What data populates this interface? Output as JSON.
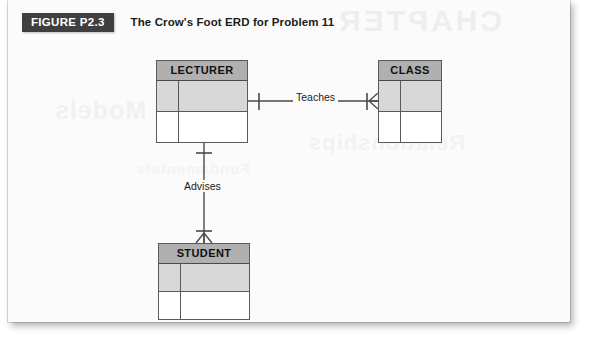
{
  "figure": {
    "tag": "FIGURE P2.3",
    "title": "The Crow's Foot ERD for Problem 11"
  },
  "ghost_text": {
    "chapter": "CHAPTER",
    "line2": "Data Models",
    "line3": "Fundamentals",
    "line4": "Relationships"
  },
  "entities": [
    {
      "id": "lecturer",
      "name": "LECTURER",
      "x": 148,
      "y": 60,
      "width": 92,
      "height": 83,
      "rows": [
        {
          "shaded": true,
          "cells": [
            "",
            ""
          ]
        },
        {
          "shaded": false,
          "cells": [
            "",
            ""
          ]
        }
      ]
    },
    {
      "id": "class",
      "name": "CLASS",
      "x": 370,
      "y": 60,
      "width": 64,
      "height": 83,
      "rows": [
        {
          "shaded": true,
          "cells": [
            "",
            ""
          ]
        },
        {
          "shaded": false,
          "cells": [
            "",
            ""
          ]
        }
      ]
    },
    {
      "id": "student",
      "name": "STUDENT",
      "x": 150,
      "y": 243,
      "width": 92,
      "height": 77,
      "rows": [
        {
          "shaded": true,
          "cells": [
            "",
            ""
          ]
        },
        {
          "shaded": false,
          "cells": [
            "",
            ""
          ]
        }
      ]
    }
  ],
  "relationships": [
    {
      "id": "teaches",
      "label": "Teaches",
      "from": "LECTURER",
      "to": "CLASS",
      "from_cardinality": "one",
      "to_cardinality": "many",
      "orientation": "horizontal"
    },
    {
      "id": "advises",
      "label": "Advises",
      "from": "LECTURER",
      "to": "STUDENT",
      "from_cardinality": "one",
      "to_cardinality": "many",
      "orientation": "vertical"
    }
  ],
  "colors": {
    "page_background": "#fbfbfb",
    "tag_background": "#3f3f3f",
    "tag_text": "#ffffff",
    "entity_header_fill": "#b0b0b0",
    "entity_shaded_row": "#d8d8d8",
    "entity_border": "#5a5a5a",
    "line": "#4a4a4a",
    "title_text": "#1b1b1b"
  }
}
